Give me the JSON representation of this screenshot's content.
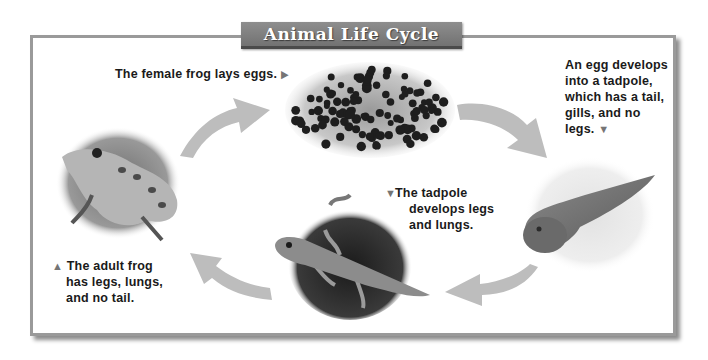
{
  "title": "Animal Life Cycle",
  "stages": [
    {
      "name": "egg mass",
      "caption": "The female frog lays eggs.",
      "pointer": "right-triangle"
    },
    {
      "name": "tadpole",
      "caption_lines": [
        "An egg develops",
        "into a tadpole,",
        "which has a tail,",
        "gills, and no",
        "legs."
      ],
      "pointer": "down-triangle"
    },
    {
      "name": "tadpole with legs",
      "caption_lines": [
        "The tadpole",
        "develops legs",
        "and lungs."
      ],
      "pointer": "down-triangle"
    },
    {
      "name": "adult frog",
      "caption_lines": [
        "The adult frog",
        "has legs, lungs,",
        "and no tail."
      ],
      "pointer": "up-triangle"
    }
  ],
  "icons": {
    "right": "▶",
    "down": "▼",
    "up": "▲"
  },
  "colors": {
    "banner": "#7e7e7e",
    "frame_border": "#9a9a9a",
    "arrow": "#bdbdbd",
    "text": "#1a1a1a"
  }
}
